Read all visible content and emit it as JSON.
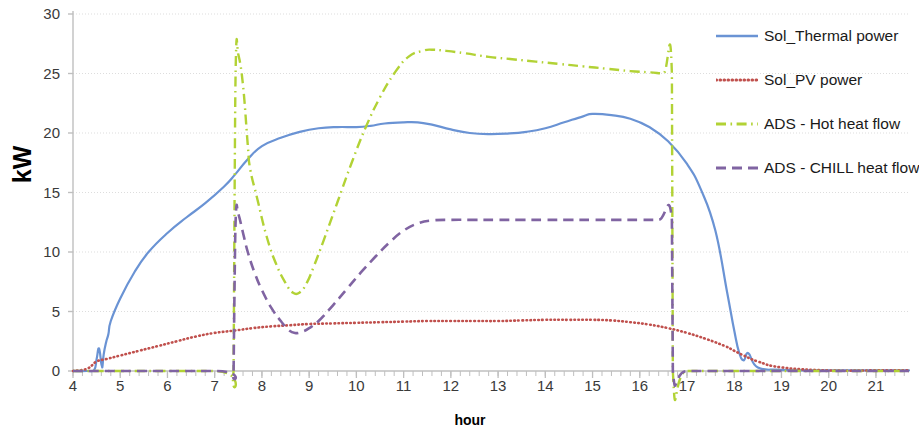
{
  "chart_data": {
    "type": "line",
    "title": "",
    "xlabel": "hour",
    "ylabel": "kW",
    "xlim": [
      4,
      21.7
    ],
    "ylim": [
      0,
      30
    ],
    "grid": true,
    "legend_position": "right",
    "x_ticks": [
      4,
      5,
      6,
      7,
      8,
      9,
      10,
      11,
      12,
      13,
      14,
      15,
      16,
      17,
      18,
      19,
      20,
      21
    ],
    "y_ticks": [
      0,
      5,
      10,
      15,
      20,
      25,
      30
    ],
    "x_minor_tick_interval": 0.2,
    "colors": {
      "sol_thermal": "#6A93D4",
      "sol_pv": "#C0504D",
      "ads_hot": "#B2D235",
      "ads_chill": "#8064A2",
      "gridline": "#DDDDDD",
      "axis": "#BFBFBF",
      "tick_text": "#3A3A3A",
      "title_text": "#000000"
    },
    "series": [
      {
        "name": "Sol_Thermal power",
        "color": "#6A93D4",
        "style": "solid",
        "x": [
          4.0,
          4.3,
          4.45,
          4.5,
          4.55,
          4.6,
          4.62,
          4.65,
          4.7,
          4.75,
          4.8,
          5.0,
          5.3,
          5.6,
          6.0,
          6.4,
          6.8,
          7.2,
          7.43,
          7.7,
          8.0,
          8.4,
          8.8,
          9.2,
          9.6,
          10.0,
          10.3,
          10.6,
          11.0,
          11.3,
          11.6,
          12.0,
          12.4,
          12.8,
          13.2,
          13.6,
          14.0,
          14.4,
          14.8,
          15.0,
          15.4,
          15.8,
          16.2,
          16.6,
          17.0,
          17.3,
          17.6,
          17.85,
          18.0,
          18.1,
          18.2,
          18.3,
          18.5,
          19.0,
          20.0,
          21.0,
          21.7
        ],
        "y": [
          0.0,
          0.0,
          0.1,
          1.0,
          1.9,
          0.6,
          0.3,
          1.4,
          2.4,
          3.1,
          4.2,
          6.1,
          8.3,
          10.0,
          11.6,
          12.9,
          14.1,
          15.5,
          16.5,
          17.8,
          18.9,
          19.6,
          20.1,
          20.4,
          20.5,
          20.5,
          20.6,
          20.8,
          20.9,
          20.9,
          20.7,
          20.3,
          20.0,
          19.9,
          19.95,
          20.1,
          20.4,
          20.9,
          21.4,
          21.6,
          21.5,
          21.2,
          20.5,
          19.3,
          17.4,
          15.2,
          11.8,
          6.6,
          3.4,
          1.6,
          0.9,
          1.5,
          0.3,
          0.1,
          0.05,
          0.05,
          0.05
        ]
      },
      {
        "name": "Sol_PV power",
        "color": "#C0504D",
        "style": "dotted",
        "x": [
          4.0,
          4.3,
          4.5,
          4.7,
          5.0,
          5.4,
          5.8,
          6.2,
          6.6,
          7.0,
          7.43,
          7.8,
          8.2,
          8.6,
          9.0,
          9.5,
          10.0,
          10.5,
          11.0,
          11.5,
          12.0,
          12.5,
          13.0,
          13.5,
          14.0,
          14.5,
          15.0,
          15.4,
          15.8,
          16.2,
          16.6,
          17.0,
          17.4,
          17.8,
          18.0,
          18.2,
          18.5,
          19.0,
          20.0,
          21.0,
          21.7
        ],
        "y": [
          0.0,
          0.2,
          0.8,
          1.0,
          1.3,
          1.7,
          2.1,
          2.5,
          2.9,
          3.2,
          3.4,
          3.6,
          3.75,
          3.85,
          3.95,
          4.0,
          4.05,
          4.1,
          4.15,
          4.2,
          4.2,
          4.2,
          4.2,
          4.25,
          4.3,
          4.3,
          4.3,
          4.25,
          4.1,
          3.9,
          3.6,
          3.2,
          2.7,
          2.1,
          1.7,
          1.3,
          0.8,
          0.3,
          0.05,
          0.05,
          0.05
        ]
      },
      {
        "name": "ADS - Hot heat flow",
        "color": "#B2D235",
        "style": "dashdot",
        "x": [
          4.0,
          7.0,
          7.4,
          7.42,
          7.45,
          7.5,
          7.6,
          7.7,
          7.75,
          7.9,
          8.1,
          8.3,
          8.5,
          8.65,
          8.8,
          8.95,
          9.1,
          9.3,
          9.6,
          9.9,
          10.2,
          10.5,
          10.8,
          11.1,
          11.4,
          11.6,
          11.9,
          12.3,
          12.8,
          13.3,
          13.8,
          14.3,
          14.8,
          15.3,
          15.8,
          16.2,
          16.5,
          16.68,
          16.7,
          17.0,
          18.0,
          19.0,
          20.0,
          21.0,
          21.7
        ],
        "y": [
          0.0,
          0.0,
          0.0,
          14.0,
          26.5,
          26.6,
          24.0,
          19.0,
          17.0,
          14.5,
          11.3,
          9.0,
          7.4,
          6.6,
          6.6,
          7.4,
          8.8,
          10.9,
          14.2,
          17.5,
          20.5,
          23.0,
          25.0,
          26.4,
          26.9,
          27.0,
          26.9,
          26.7,
          26.4,
          26.2,
          26.0,
          25.8,
          25.6,
          25.4,
          25.2,
          25.1,
          25.0,
          25.0,
          0.0,
          0.0,
          0.0,
          0.0,
          0.0,
          0.0,
          0.0
        ]
      },
      {
        "name": "ADS - CHILL heat flow",
        "color": "#8064A2",
        "style": "dashed",
        "x": [
          4.0,
          7.0,
          7.4,
          7.42,
          7.45,
          7.5,
          7.6,
          7.7,
          7.85,
          8.0,
          8.2,
          8.4,
          8.55,
          8.7,
          8.85,
          9.0,
          9.2,
          9.5,
          9.8,
          10.1,
          10.4,
          10.7,
          11.0,
          11.3,
          11.6,
          12.0,
          12.5,
          13.0,
          13.5,
          14.0,
          14.5,
          15.0,
          15.5,
          16.0,
          16.4,
          16.68,
          16.7,
          17.0,
          18.0,
          19.0,
          20.0,
          21.0,
          21.7
        ],
        "y": [
          0.0,
          0.0,
          0.0,
          7.0,
          13.3,
          13.2,
          11.6,
          10.0,
          8.2,
          6.8,
          5.3,
          4.2,
          3.5,
          3.2,
          3.3,
          3.6,
          4.2,
          5.5,
          6.9,
          8.3,
          9.6,
          10.8,
          11.8,
          12.4,
          12.65,
          12.7,
          12.7,
          12.7,
          12.7,
          12.7,
          12.7,
          12.7,
          12.7,
          12.7,
          12.7,
          12.7,
          0.0,
          0.0,
          0.0,
          0.0,
          0.0,
          0.0,
          0.0
        ]
      }
    ]
  },
  "axes": {
    "y_title": "kW",
    "x_title": "hour",
    "y_tick_labels": [
      "0",
      "5",
      "10",
      "15",
      "20",
      "25",
      "30"
    ],
    "x_tick_labels": [
      "4",
      "5",
      "6",
      "7",
      "8",
      "9",
      "10",
      "11",
      "12",
      "13",
      "14",
      "15",
      "16",
      "17",
      "18",
      "19",
      "20",
      "21"
    ]
  },
  "legend": {
    "items": [
      {
        "label": "Sol_Thermal power",
        "color": "#6A93D4",
        "style": "solid"
      },
      {
        "label": "Sol_PV power",
        "color": "#C0504D",
        "style": "dotted"
      },
      {
        "label": "ADS - Hot heat flow",
        "color": "#B2D235",
        "style": "dashdot"
      },
      {
        "label": "ADS - CHILL heat flow",
        "color": "#8064A2",
        "style": "dashed"
      }
    ]
  }
}
